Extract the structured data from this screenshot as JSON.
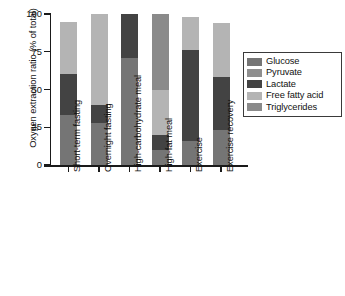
{
  "chart_data": {
    "type": "bar",
    "subtype": "stacked-vertical",
    "title": "",
    "xlabel": "",
    "ylabel": "Oxygen extraction ratio (% of total)",
    "ylim": [
      0,
      100
    ],
    "yticks": [
      0,
      25,
      50,
      75,
      100
    ],
    "ytick_labels": [
      "0",
      "25",
      "50",
      "75",
      "100"
    ],
    "grid": false,
    "legend_position": "right",
    "categories": [
      "Short-term fasting",
      "Overnight fasting",
      "High-carbohydrate meal",
      "High-fat meal",
      "Exercise",
      "Exercise recovery"
    ],
    "series": [
      {
        "name": "Glucose",
        "color": "#757575",
        "values": [
          33,
          28,
          71,
          10,
          16,
          23
        ]
      },
      {
        "name": "Pyruvate",
        "color": "#8f8f8f",
        "values": [
          0,
          0,
          0,
          0,
          0,
          0
        ]
      },
      {
        "name": "Lactate",
        "color": "#434343",
        "values": [
          27,
          12,
          29,
          10,
          60,
          35
        ]
      },
      {
        "name": "Free fatty acid",
        "color": "#b4b4b4",
        "values": [
          35,
          60,
          0,
          30,
          22,
          36
        ]
      },
      {
        "name": "Triglycerides",
        "color": "#8a8a8a",
        "values": [
          0,
          0,
          0,
          50,
          0,
          0
        ]
      }
    ],
    "totals": [
      95,
      100,
      100,
      100,
      98,
      94
    ],
    "axis_color": "#1a1a1a",
    "background": "#ffffff"
  },
  "legend": {
    "items": [
      {
        "label": "Glucose",
        "color": "#757575"
      },
      {
        "label": "Pyruvate",
        "color": "#8f8f8f"
      },
      {
        "label": "Lactate",
        "color": "#434343"
      },
      {
        "label": "Free fatty acid",
        "color": "#b4b4b4"
      },
      {
        "label": "Triglycerides",
        "color": "#8a8a8a"
      }
    ]
  }
}
